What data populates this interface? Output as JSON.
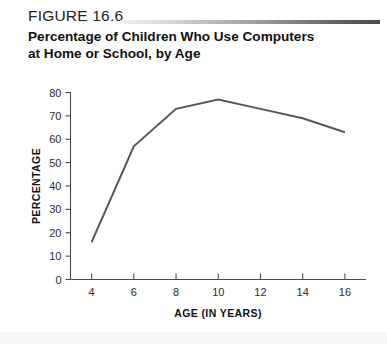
{
  "figure": {
    "number": "FIGURE 16.6",
    "title_line1": "Percentage of Children Who Use Computers",
    "title_line2": "at Home or School, by Age"
  },
  "colors": {
    "line": "#575757",
    "axis": "#4a4a4a",
    "rule_dark": "#4a4a4a",
    "rule_light": "#f2f2f2",
    "background": "#ffffff",
    "text": "#111111"
  },
  "chart_data": {
    "type": "line",
    "title": "Percentage of Children Who Use Computers at Home or School, by Age",
    "xlabel": "AGE (IN YEARS)",
    "ylabel": "PERCENTAGE",
    "x": [
      4,
      6,
      8,
      10,
      12,
      14,
      16
    ],
    "values": [
      16,
      57,
      73,
      77,
      73,
      69,
      63
    ],
    "xticks": [
      "4",
      "6",
      "8",
      "10",
      "12",
      "14",
      "16"
    ],
    "yticks": [
      "0",
      "10",
      "20",
      "30",
      "40",
      "50",
      "60",
      "70",
      "80"
    ],
    "xlim": [
      3,
      17
    ],
    "ylim": [
      0,
      80
    ],
    "grid": false,
    "legend": false
  }
}
